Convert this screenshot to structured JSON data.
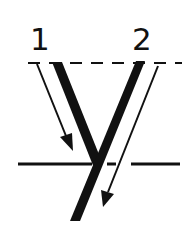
{
  "diagram": {
    "letter": "y",
    "stroke_labels": [
      "1",
      "2"
    ],
    "colors": {
      "ink": "#111111",
      "background": "#ffffff"
    },
    "guides": {
      "top_line": "dashed",
      "baseline": "solid"
    },
    "strokes": [
      {
        "order": "1",
        "direction": "down-right",
        "meets": "stroke 2 at baseline"
      },
      {
        "order": "2",
        "direction": "down-left",
        "extends": "below baseline"
      }
    ]
  }
}
